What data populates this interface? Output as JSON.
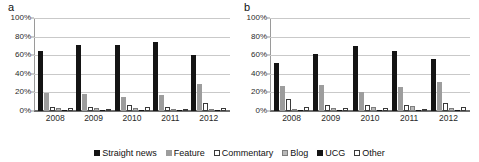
{
  "figure": {
    "panel_a_label": "a",
    "panel_b_label": "b"
  },
  "legend": {
    "items": [
      {
        "label": "Straight news",
        "swatch": "sw-straight",
        "color": "#141414"
      },
      {
        "label": "Feature",
        "swatch": "sw-feature",
        "color": "#9d9d9d"
      },
      {
        "label": "Commentary",
        "swatch": "sw-commentary",
        "color": "#ffffff"
      },
      {
        "label": "Blog",
        "swatch": "sw-blog",
        "color": "#b9b9b9"
      },
      {
        "label": "UCG",
        "swatch": "sw-ucg",
        "color": "#141414"
      },
      {
        "label": "Other",
        "swatch": "sw-other",
        "color": "#ffffff"
      }
    ]
  },
  "chart_data": [
    {
      "type": "bar",
      "title": "a",
      "xlabel": "",
      "ylabel": "",
      "ylim": [
        0,
        100
      ],
      "yticks": [
        "0%",
        "20%",
        "40%",
        "60%",
        "80%",
        "100%"
      ],
      "ytick_values": [
        0,
        20,
        40,
        60,
        80,
        100
      ],
      "grid": true,
      "legend_position": "bottom",
      "categories": [
        "2008",
        "2009",
        "2010",
        "2011",
        "2012"
      ],
      "series": [
        {
          "name": "Straight news",
          "values": [
            65,
            71,
            71,
            74,
            60
          ]
        },
        {
          "name": "Feature",
          "values": [
            19,
            18,
            15,
            17,
            29
          ]
        },
        {
          "name": "Commentary",
          "values": [
            4,
            4,
            6,
            4,
            9
          ]
        },
        {
          "name": "Blog",
          "values": [
            3,
            3,
            3,
            1,
            2
          ]
        },
        {
          "name": "UCG",
          "values": [
            1,
            1,
            1,
            1,
            1
          ]
        },
        {
          "name": "Other",
          "values": [
            3,
            2,
            4,
            2,
            3
          ]
        }
      ]
    },
    {
      "type": "bar",
      "title": "b",
      "xlabel": "",
      "ylabel": "",
      "ylim": [
        0,
        100
      ],
      "yticks": [
        "0%",
        "20%",
        "40%",
        "60%",
        "80%",
        "100%"
      ],
      "ytick_values": [
        0,
        20,
        40,
        60,
        80,
        100
      ],
      "grid": true,
      "legend_position": "bottom",
      "categories": [
        "2008",
        "2009",
        "2010",
        "2011",
        "2012"
      ],
      "series": [
        {
          "name": "Straight news",
          "values": [
            52,
            61,
            70,
            64,
            56
          ]
        },
        {
          "name": "Feature",
          "values": [
            27,
            28,
            20,
            26,
            31
          ]
        },
        {
          "name": "Commentary",
          "values": [
            13,
            6,
            6,
            6,
            9
          ]
        },
        {
          "name": "Blog",
          "values": [
            2,
            3,
            4,
            5,
            3
          ]
        },
        {
          "name": "UCG",
          "values": [
            1,
            1,
            1,
            1,
            1
          ]
        },
        {
          "name": "Other",
          "values": [
            4,
            3,
            3,
            1,
            4
          ]
        }
      ]
    }
  ]
}
